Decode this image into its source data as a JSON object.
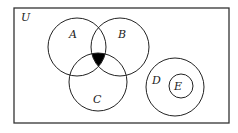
{
  "diagram": {
    "type": "venn",
    "universe": {
      "label": "U",
      "rect": {
        "x": 14,
        "y": 8,
        "w": 215,
        "h": 115
      }
    },
    "sets": [
      {
        "label": "A",
        "cx": 77,
        "cy": 47,
        "r": 29,
        "label_x": 73,
        "label_y": 38
      },
      {
        "label": "B",
        "cx": 120,
        "cy": 47,
        "r": 29,
        "label_x": 122,
        "label_y": 38
      },
      {
        "label": "C",
        "cx": 98,
        "cy": 82,
        "r": 29,
        "label_x": 97,
        "label_y": 102
      },
      {
        "label": "D",
        "cx": 175,
        "cy": 87,
        "r": 29,
        "label_x": 157,
        "label_y": 83
      },
      {
        "label": "E",
        "cx": 181,
        "cy": 86,
        "r": 12,
        "label_x": 178,
        "label_y": 90
      }
    ],
    "shaded_region": "A ∩ B ∩ C",
    "colors": {
      "stroke": "#222222",
      "shade": "#000000",
      "background": "#ffffff"
    }
  }
}
